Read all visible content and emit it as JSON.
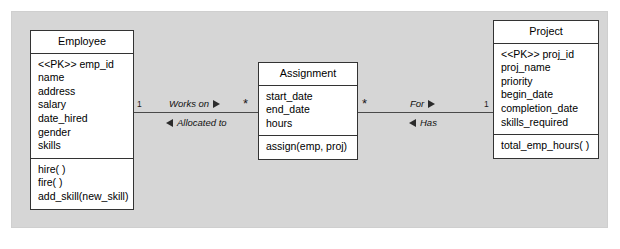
{
  "diagram": {
    "type": "uml-class-diagram",
    "panel_color": "#d6d6d6",
    "box_fill": "#ffffff",
    "box_border": "#333333"
  },
  "classes": {
    "employee": {
      "name": "Employee",
      "attributes": [
        "<<PK>> emp_id",
        "name",
        "address",
        "salary",
        "date_hired",
        "gender",
        "skills"
      ],
      "operations": [
        "hire( )",
        "fire( )",
        "add_skill(new_skill)"
      ]
    },
    "assignment": {
      "name": "Assignment",
      "attributes": [
        "start_date",
        "end_date",
        "hours"
      ],
      "operations": [
        "assign(emp, proj)"
      ]
    },
    "project": {
      "name": "Project",
      "attributes": [
        "<<PK>> proj_id",
        "proj_name",
        "priority",
        "begin_date",
        "completion_date",
        "skills_required"
      ],
      "operations": [
        "total_emp_hours( )"
      ]
    }
  },
  "associations": {
    "left": {
      "source_multiplicity": "1",
      "target_multiplicity": "*",
      "forward_role": "Works on",
      "forward_direction": "right",
      "reverse_role": "Allocated to",
      "reverse_direction": "left"
    },
    "right": {
      "source_multiplicity": "*",
      "target_multiplicity": "1",
      "forward_role": "For",
      "forward_direction": "right",
      "reverse_role": "Has",
      "reverse_direction": "left"
    }
  }
}
